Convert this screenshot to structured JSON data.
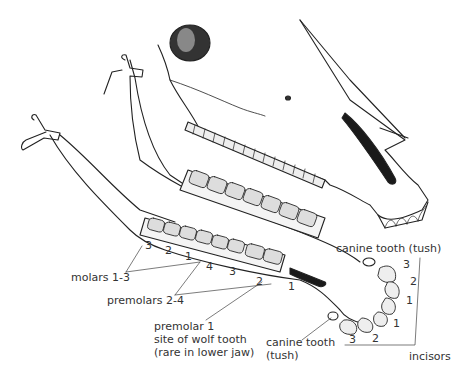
{
  "diagram": {
    "labels": {
      "molars": "molars 1-3",
      "premolars": "premolars 2-4",
      "premolar1_line1": "premolar 1",
      "premolar1_line2": "site of wolf tooth",
      "premolar1_line3": "(rare in lower jaw)",
      "canine_upper": "canine tooth (tush)",
      "canine_lower_line1": "canine tooth",
      "canine_lower_line2": "(tush)",
      "incisors": "incisors"
    },
    "tooth_numbers": {
      "molar_3": "3",
      "molar_2": "2",
      "molar_1": "1",
      "premolar_4": "4",
      "premolar_3": "3",
      "premolar_2": "2",
      "premolar_1": "1",
      "incisor_upper_3": "3",
      "incisor_upper_2": "2",
      "incisor_upper_1": "1",
      "incisor_lower_1": "1",
      "incisor_lower_2": "2",
      "incisor_lower_3": "3"
    }
  }
}
